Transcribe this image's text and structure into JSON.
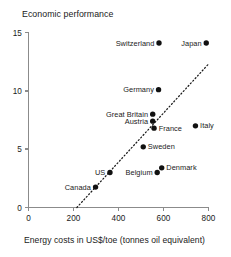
{
  "chart_data": {
    "type": "scatter",
    "title": "Economic performance",
    "subtitle": "",
    "xlabel": "Energy costs in US$/toe (tonnes oil equivalent)",
    "ylabel": "Economic performance",
    "xlim": [
      0,
      800
    ],
    "ylim": [
      0,
      15
    ],
    "xticks": [
      0,
      200,
      400,
      600,
      800
    ],
    "yticks": [
      0,
      5,
      10,
      15
    ],
    "xtick_labels": [
      "0",
      "200",
      "400",
      "600",
      "800"
    ],
    "ytick_labels": [
      "0",
      "5",
      "10",
      "15"
    ],
    "grid": false,
    "legend": "none",
    "marker_color": "#111111",
    "axis_color": "#8b8b8b",
    "points": [
      {
        "label": "Switzerland",
        "x": 580,
        "y": 14.1,
        "label_pos": "left"
      },
      {
        "label": "Japan",
        "x": 790,
        "y": 14.1,
        "label_pos": "left"
      },
      {
        "label": "Germany",
        "x": 578,
        "y": 10.1,
        "label_pos": "left"
      },
      {
        "label": "Great Britain",
        "x": 552,
        "y": 8.0,
        "label_pos": "left"
      },
      {
        "label": "Austria",
        "x": 552,
        "y": 7.4,
        "label_pos": "left"
      },
      {
        "label": "France",
        "x": 558,
        "y": 6.8,
        "label_pos": "right"
      },
      {
        "label": "Italy",
        "x": 742,
        "y": 7.0,
        "label_pos": "right"
      },
      {
        "label": "Sweden",
        "x": 510,
        "y": 5.2,
        "label_pos": "right"
      },
      {
        "label": "Denmark",
        "x": 592,
        "y": 3.4,
        "label_pos": "right"
      },
      {
        "label": "Belgium",
        "x": 572,
        "y": 3.0,
        "label_pos": "left"
      },
      {
        "label": "US",
        "x": 362,
        "y": 3.0,
        "label_pos": "left"
      },
      {
        "label": "Canada",
        "x": 298,
        "y": 1.75,
        "label_pos": "left"
      }
    ],
    "trend_line": {
      "style": "dotted",
      "x_start": 215,
      "y_start": 0,
      "x_end": 800,
      "y_end": 12.3
    }
  }
}
